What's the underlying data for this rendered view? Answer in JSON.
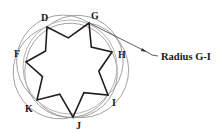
{
  "figure": {
    "type": "geometric-construction",
    "circle": {
      "cx": 70,
      "cy": 67,
      "r": 47,
      "color": "#b5b5b5"
    },
    "star_color": "#1f1f1f",
    "arc_color": "#8a8a8a",
    "points": [
      {
        "id": "D",
        "label": "D",
        "x": 47,
        "y": 27,
        "label_x": 41,
        "label_y": 13
      },
      {
        "id": "G",
        "label": "G",
        "x": 89,
        "y": 23,
        "label_x": 91,
        "label_y": 11
      },
      {
        "id": "H",
        "label": "H",
        "x": 112,
        "y": 52,
        "label_x": 118,
        "label_y": 50
      },
      {
        "id": "I",
        "label": "I",
        "x": 108,
        "y": 95,
        "label_x": 112,
        "label_y": 98
      },
      {
        "id": "J",
        "label": "J",
        "x": 73,
        "y": 117,
        "label_x": 76,
        "label_y": 121
      },
      {
        "id": "K",
        "label": "K",
        "x": 37,
        "y": 100,
        "label_x": 25,
        "label_y": 104
      },
      {
        "id": "F",
        "label": "F",
        "x": 26,
        "y": 62,
        "label_x": 14,
        "label_y": 49
      }
    ],
    "callout": {
      "text": "Radius G-I",
      "from": "G",
      "text_x": 161,
      "text_y": 52
    }
  },
  "labels": {
    "D": "D",
    "G": "G",
    "H": "H",
    "I": "I",
    "J": "J",
    "K": "K",
    "F": "F",
    "callout": "Radius G-I"
  }
}
